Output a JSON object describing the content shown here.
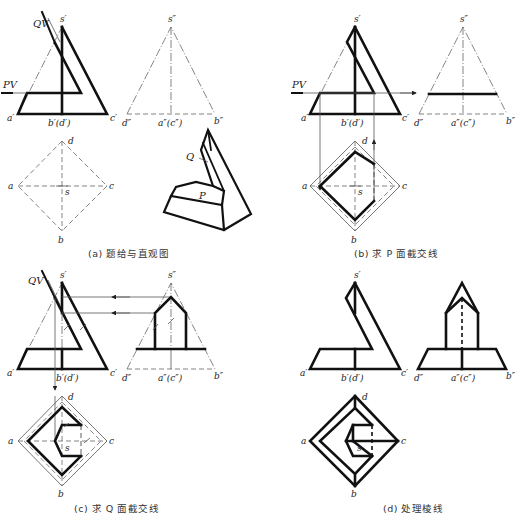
{
  "figure": {
    "panels": [
      {
        "id": "a",
        "caption": "(a) 题给与直观图",
        "labels": {
          "s_front": "s′",
          "a_front": "a′",
          "bd_front": "b′(d′)",
          "c_front": "c′",
          "s_side": "s″",
          "d_side": "d″",
          "ac_side": "a″(c″)",
          "b_side": "b″",
          "d_top": "d",
          "a_top": "a",
          "c_top": "c",
          "b_top": "b",
          "s_top": "s",
          "plane_q": "QV",
          "plane_p": "PV",
          "iso_q": "Q",
          "iso_p": "P"
        }
      },
      {
        "id": "b",
        "caption": "(b) 求 P 面截交线",
        "labels": {
          "s_front": "s′",
          "a_front": "a′",
          "bd_front": "b′(d′)",
          "c_front": "c′",
          "s_side": "s″",
          "d_side": "d″",
          "ac_side": "a″(c″)",
          "b_side": "b″",
          "d_top": "d",
          "a_top": "a",
          "c_top": "c",
          "b_top": "b",
          "s_top": "s",
          "plane_p": "PV"
        }
      },
      {
        "id": "c",
        "caption": "(c) 求 Q 面截交线",
        "labels": {
          "s_front": "s′",
          "a_front": "a′",
          "bd_front": "b′(d′)",
          "c_front": "c′",
          "s_side": "s″",
          "d_side": "d″",
          "ac_side": "a″(c″)",
          "b_side": "b″",
          "d_top": "d",
          "a_top": "a",
          "c_top": "c",
          "b_top": "b",
          "s_top": "s",
          "plane_q": "QV"
        }
      },
      {
        "id": "d",
        "caption": "(d) 处理棱线",
        "labels": {
          "s_front": "s′",
          "a_front": "a′",
          "bd_front": "b′(d′)",
          "c_front": "c′",
          "d_side": "d″",
          "ac_side": "a″(c″)",
          "b_side": "b″",
          "d_top": "d",
          "a_top": "a",
          "c_top": "c",
          "b_top": "b",
          "s_top": "s"
        }
      }
    ]
  }
}
